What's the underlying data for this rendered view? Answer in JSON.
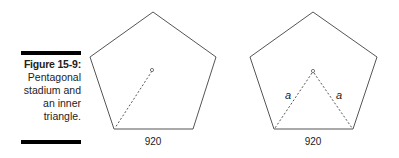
{
  "caption": {
    "label": "Figure 15-9:",
    "lines": [
      "Pentagonal",
      "stadium and",
      "an inner",
      "triangle."
    ]
  },
  "figures": [
    {
      "name": "pentagon-radius",
      "base_label": "920"
    },
    {
      "name": "pentagon-inner-triangle",
      "base_label": "920",
      "side_labels": [
        "a",
        "a"
      ]
    }
  ]
}
